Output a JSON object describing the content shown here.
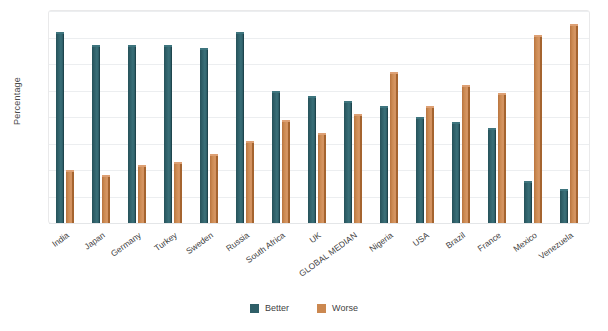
{
  "chart_data": {
    "type": "bar",
    "title": "",
    "xlabel": "",
    "ylabel": "Percentage",
    "ylim": [
      0,
      80
    ],
    "yticks": [
      0,
      10,
      20,
      30,
      40,
      50,
      60,
      70,
      80
    ],
    "grid": true,
    "legend_position": "bottom",
    "categories": [
      "India",
      "Japan",
      "Germany",
      "Turkey",
      "Sweden",
      "Russia",
      "South Africa",
      "UK",
      "GLOBAL MEDIAN",
      "Nigeria",
      "USA",
      "Brazil",
      "France",
      "Mexico",
      "Venezuela"
    ],
    "series": [
      {
        "name": "Better",
        "color": "#2f5f68",
        "values": [
          72,
          67,
          67,
          67,
          66,
          72,
          50,
          48,
          46,
          44,
          40,
          38,
          36,
          16,
          13
        ]
      },
      {
        "name": "Worse",
        "color": "#cb8850",
        "values": [
          20,
          18,
          22,
          23,
          26,
          31,
          39,
          34,
          41,
          57,
          44,
          52,
          49,
          71,
          75
        ]
      }
    ]
  },
  "legend": {
    "items": [
      {
        "label": "Better"
      },
      {
        "label": "Worse"
      }
    ]
  },
  "axis": {
    "y_title": "Percentage"
  }
}
